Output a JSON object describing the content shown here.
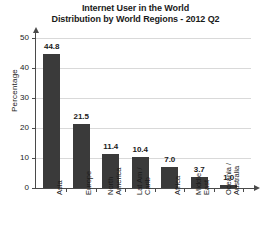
{
  "chart_data": {
    "type": "bar",
    "title": "Internet User in the World Distribution by World Regions - 2012 Q2",
    "title_lines": [
      "Internet User in the World",
      "Distribution by World Regions - 2012 Q2"
    ],
    "xlabel": "",
    "ylabel": "Percentage",
    "ylim": [
      0,
      50
    ],
    "yticks": [
      0,
      10,
      20,
      30,
      40,
      50
    ],
    "ytick_labels": [
      "0",
      "10",
      "20",
      "30",
      "40",
      "50"
    ],
    "grid": true,
    "legend": false,
    "bar_color": "#3a3a3a",
    "axis_color": "#4a4a4a",
    "grid_color": "#d9d9d9",
    "categories": [
      "Asia",
      "Europe",
      "North America",
      "Lat Am / Carib",
      "Africa",
      "Middle East",
      "Oceania / Australia"
    ],
    "category_lines": [
      [
        "Asia"
      ],
      [
        "Europe"
      ],
      [
        "North",
        "America"
      ],
      [
        "Lat Am /",
        "Carib"
      ],
      [
        "Africa"
      ],
      [
        "Middle",
        "East"
      ],
      [
        "Oceania /",
        "Australia"
      ]
    ],
    "values": [
      44.8,
      21.5,
      11.4,
      10.4,
      7.0,
      3.7,
      1.0
    ],
    "value_labels": [
      "44.8",
      "21.5",
      "11.4",
      "10.4",
      "7.0",
      "3.7",
      "1.0"
    ]
  }
}
